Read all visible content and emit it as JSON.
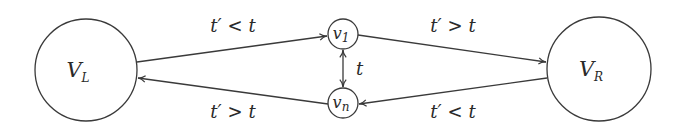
{
  "diagram": {
    "type": "directed-graph",
    "nodes": [
      {
        "id": "VL",
        "label_main": "V",
        "label_sub": "L",
        "cx": 86,
        "cy": 70,
        "r": 51
      },
      {
        "id": "v1",
        "label_main": "v",
        "label_sub": "1",
        "cx": 343,
        "cy": 34,
        "r": 15
      },
      {
        "id": "vn",
        "label_main": "v",
        "label_sub": "n",
        "cx": 343,
        "cy": 103,
        "r": 15
      },
      {
        "id": "VR",
        "label_main": "V",
        "label_sub": "R",
        "cx": 599,
        "cy": 69,
        "r": 52
      }
    ],
    "edges": [
      {
        "from": "VL",
        "to": "v1",
        "label_a": "t′",
        "label_op": "<",
        "label_b": "t"
      },
      {
        "from": "vn",
        "to": "VL",
        "label_a": "t′",
        "label_op": ">",
        "label_b": "t"
      },
      {
        "from": "v1",
        "to": "VR",
        "label_a": "t′",
        "label_op": ">",
        "label_b": "t"
      },
      {
        "from": "VR",
        "to": "vn",
        "label_a": "t′",
        "label_op": "<",
        "label_b": "t"
      },
      {
        "from": "v1",
        "to": "vn",
        "bidirectional": true,
        "label": "t"
      }
    ],
    "colors": {
      "stroke": "#3a3a3a",
      "text": "#2a2a2a",
      "background": "#ffffff"
    }
  }
}
